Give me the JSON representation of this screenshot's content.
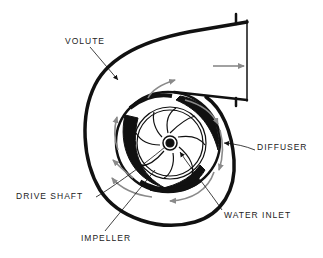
{
  "diagram": {
    "labels": {
      "volute": "VOLUTE",
      "diffuser": "DIFFUSER",
      "drive_shaft": "DRIVE SHAFT",
      "water_inlet": "WATER INLET",
      "impeller": "IMPELLER"
    },
    "colors": {
      "line": "#111111",
      "arrow": "#8a8a8a",
      "background": "#ffffff"
    }
  }
}
